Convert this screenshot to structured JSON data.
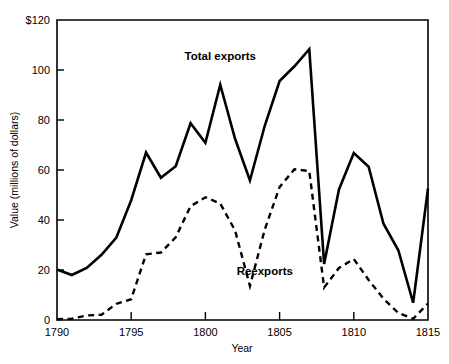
{
  "chart_data": {
    "type": "line",
    "title": "",
    "xlabel": "Year",
    "ylabel": "Value (millions of dollars)",
    "xlim": [
      1790,
      1815
    ],
    "ylim": [
      0,
      120
    ],
    "grid": false,
    "legend_position": "inline-annotation",
    "x": [
      1790,
      1791,
      1792,
      1793,
      1794,
      1795,
      1796,
      1797,
      1798,
      1799,
      1800,
      1801,
      1802,
      1803,
      1804,
      1805,
      1806,
      1807,
      1808,
      1809,
      1810,
      1811,
      1812,
      1813,
      1814,
      1815
    ],
    "series": [
      {
        "name": "Total exports",
        "style": "solid",
        "values": [
          20.2,
          18.0,
          20.8,
          26.1,
          33.0,
          47.9,
          67.0,
          56.9,
          61.5,
          78.7,
          70.9,
          94.1,
          72.5,
          55.8,
          77.7,
          95.6,
          101.5,
          108.3,
          22.4,
          52.2,
          66.8,
          61.3,
          38.5,
          27.9,
          6.9,
          52.6
        ]
      },
      {
        "name": "Reexports",
        "style": "dashed",
        "values": [
          0.3,
          0.5,
          1.8,
          2.1,
          6.5,
          8.3,
          26.3,
          27.0,
          33.1,
          45.5,
          49.1,
          46.6,
          35.8,
          13.6,
          36.2,
          53.2,
          60.3,
          59.6,
          13.0,
          20.8,
          24.4,
          16.0,
          8.5,
          2.8,
          0.5,
          6.6
        ]
      }
    ],
    "annotations": [
      {
        "text": "Total exports",
        "x": 1801,
        "y": 104
      },
      {
        "text": "Reexports",
        "x": 1804,
        "y": 18
      }
    ],
    "x_ticks": [
      {
        "value": 1790,
        "label": "1790"
      },
      {
        "value": 1795,
        "label": "1795"
      },
      {
        "value": 1800,
        "label": "1800"
      },
      {
        "value": 1805,
        "label": "1805"
      },
      {
        "value": 1810,
        "label": "1810"
      },
      {
        "value": 1815,
        "label": "1815"
      }
    ],
    "y_ticks": [
      {
        "value": 0,
        "label": "0"
      },
      {
        "value": 20,
        "label": "20"
      },
      {
        "value": 40,
        "label": "40"
      },
      {
        "value": 60,
        "label": "60"
      },
      {
        "value": 80,
        "label": "80"
      },
      {
        "value": 100,
        "label": "100"
      },
      {
        "value": 120,
        "label": "$120"
      }
    ],
    "colors": {
      "axis": "#000000",
      "total_exports": "#000000",
      "reexports": "#000000",
      "background": "#ffffff"
    }
  }
}
